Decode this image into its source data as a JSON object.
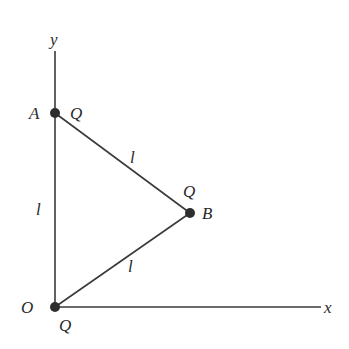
{
  "diagram": {
    "axes": {
      "x_label": "x",
      "y_label": "y",
      "origin_label": "O"
    },
    "points": [
      {
        "name": "A",
        "charge": "Q",
        "position": "on y-axis, distance l from origin"
      },
      {
        "name": "B",
        "charge": "Q",
        "position": "right of y-axis, equidistant l from A and O"
      },
      {
        "name": "O",
        "charge": "Q",
        "position": "origin"
      }
    ],
    "sides": [
      {
        "from": "O",
        "to": "A",
        "label": "l"
      },
      {
        "from": "A",
        "to": "B",
        "label": "l"
      },
      {
        "from": "O",
        "to": "B",
        "label": "l"
      }
    ],
    "labels": {
      "A": "A",
      "B": "B",
      "O": "O",
      "charge_A": "Q",
      "charge_B": "Q",
      "charge_O": "Q",
      "side_OA": "l",
      "side_AB": "l",
      "side_OB": "l"
    },
    "colors": {
      "line": "#3a3a3a",
      "point": "#2e2e2e",
      "text": "#2a2a2a",
      "background": "#ffffff"
    }
  }
}
